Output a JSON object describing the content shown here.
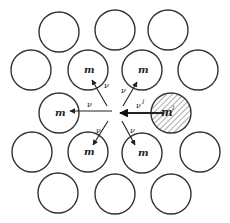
{
  "figure": {
    "stroke_color": "#333333",
    "background": "#ffffff",
    "radius": 20,
    "center": {
      "x": 115,
      "y": 113
    }
  },
  "circles": [
    {
      "x": 59,
      "y": 32,
      "label": ""
    },
    {
      "x": 115,
      "y": 30,
      "label": ""
    },
    {
      "x": 168,
      "y": 30,
      "label": ""
    },
    {
      "x": 31,
      "y": 70,
      "label": ""
    },
    {
      "x": 88,
      "y": 70,
      "label": "m"
    },
    {
      "x": 142,
      "y": 70,
      "label": "m"
    },
    {
      "x": 198,
      "y": 70,
      "label": ""
    },
    {
      "x": 59,
      "y": 113,
      "label": "m"
    },
    {
      "x": 171,
      "y": 113,
      "label": "m'",
      "hatched": true
    },
    {
      "x": 32,
      "y": 152,
      "label": ""
    },
    {
      "x": 88,
      "y": 152,
      "label": "m"
    },
    {
      "x": 142,
      "y": 153,
      "label": "m"
    },
    {
      "x": 200,
      "y": 152,
      "label": ""
    },
    {
      "x": 58,
      "y": 193,
      "label": ""
    },
    {
      "x": 115,
      "y": 194,
      "label": ""
    },
    {
      "x": 171,
      "y": 194,
      "label": ""
    }
  ],
  "labels": {
    "m": "m",
    "m_prime": "m",
    "m_prime_sup": "I",
    "v": "ν",
    "v_prime": "ν",
    "v_prime_sup": "I"
  },
  "arrows": [
    {
      "from": [
        112,
        111
      ],
      "to": [
        70,
        111
      ],
      "label": "ν",
      "lx": 87,
      "ly": 107
    },
    {
      "from": [
        107,
        106
      ],
      "to": [
        92,
        80
      ],
      "label": "ν",
      "lx": 104,
      "ly": 88
    },
    {
      "from": [
        123,
        106
      ],
      "to": [
        137,
        82
      ],
      "label": "ν",
      "lx": 121,
      "ly": 93
    },
    {
      "from": [
        108,
        121
      ],
      "to": [
        93,
        145
      ],
      "label": "ν",
      "lx": 96,
      "ly": 133
    },
    {
      "from": [
        122,
        121
      ],
      "to": [
        135,
        145
      ],
      "label": "ν",
      "lx": 130,
      "ly": 133
    },
    {
      "from": [
        164,
        113
      ],
      "to": [
        120,
        113
      ],
      "label": "ν",
      "lx": 136,
      "ly": 108,
      "bold": true,
      "sup": "I"
    }
  ]
}
